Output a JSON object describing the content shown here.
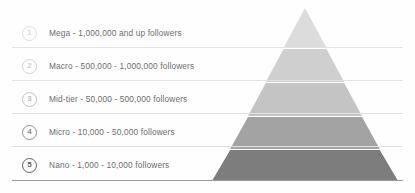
{
  "diagram": {
    "type": "pyramid",
    "background_color": "#fefefe",
    "divider_color": "#e2e2e2",
    "baseline_color": "#9a9a9a",
    "label_color": "#6d6d6d",
    "apex": {
      "x": 305,
      "y": 8
    },
    "base": {
      "left_x": 205,
      "right_x": 405,
      "y": 180
    },
    "tiers": [
      {
        "rank": "1",
        "name": "Mega",
        "label": "Mega - 1,000,000 and up followers",
        "range_min": "1,000,000",
        "range_max": "and up",
        "band_color": "#dcdcdc",
        "badge_border_color": "#dfdfdf",
        "badge_text_color": "#dcdcdc",
        "row_y": 18,
        "band_top_y": 8,
        "band_bottom_y": 48
      },
      {
        "rank": "2",
        "name": "Macro",
        "label": "Macro - 500,000 - 1,000,000 followers",
        "range_min": "500,000",
        "range_max": "1,000,000",
        "band_color": "#cfcfcf",
        "badge_border_color": "#d2d2d2",
        "badge_text_color": "#cfcfcf",
        "row_y": 48,
        "band_top_y": 48,
        "band_bottom_y": 81
      },
      {
        "rank": "3",
        "name": "Mid-tier",
        "label": "Mid-tier - 50,000 - 500,000 followers",
        "range_min": "50,000",
        "range_max": "500,000",
        "band_color": "#c4c4c4",
        "badge_border_color": "#c2c2c2",
        "badge_text_color": "#bdbdbd",
        "row_y": 81,
        "band_top_y": 81,
        "band_bottom_y": 114
      },
      {
        "rank": "4",
        "name": "Micro",
        "label": "Micro - 10,000 - 50,000 followers",
        "range_min": "10,000",
        "range_max": "50,000",
        "band_color": "#a3a3a3",
        "badge_border_color": "#8e8e8e",
        "badge_text_color": "#8e8e8e",
        "row_y": 114,
        "band_top_y": 114,
        "band_bottom_y": 147
      },
      {
        "rank": "5",
        "name": "Nano",
        "label": "Nano - 1,000 - 10,000 followers",
        "range_min": "1,000",
        "range_max": "10,000",
        "band_color": "#7d7d7d",
        "badge_border_color": "#5f5f5f",
        "badge_text_color": "#5f5f5f",
        "row_y": 147,
        "band_top_y": 147,
        "band_bottom_y": 180
      }
    ]
  }
}
